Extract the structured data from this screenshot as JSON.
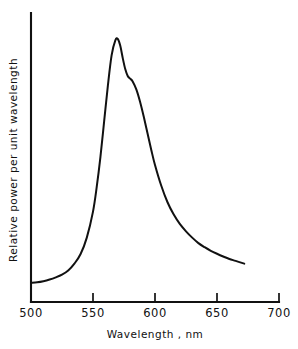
{
  "chart_data": {
    "type": "line",
    "title": "",
    "xlabel": "Wavelength , nm",
    "ylabel": "Relative power per unit wavelength",
    "xlim": [
      500,
      700
    ],
    "ylim": [
      0,
      1.0
    ],
    "xticks": [
      500,
      550,
      600,
      650,
      700
    ],
    "xtick_labels": [
      "500",
      "550",
      "600",
      "650",
      "700"
    ],
    "yticks": [],
    "ytick_labels": [],
    "grid": false,
    "legend": false,
    "series": [
      {
        "name": "Relative spectral power",
        "color": "#111111",
        "x": [
          500,
          505,
          510,
          515,
          520,
          525,
          530,
          535,
          540,
          545,
          550,
          553,
          556,
          559,
          562,
          565,
          568,
          570,
          572,
          574,
          576,
          578,
          580,
          582,
          585,
          588,
          591,
          594,
          597,
          600,
          605,
          610,
          615,
          620,
          625,
          630,
          635,
          640,
          645,
          650,
          655,
          660,
          665,
          672
        ],
        "y": [
          0.07,
          0.072,
          0.076,
          0.082,
          0.09,
          0.1,
          0.115,
          0.14,
          0.175,
          0.235,
          0.33,
          0.42,
          0.53,
          0.66,
          0.79,
          0.9,
          0.955,
          0.96,
          0.935,
          0.89,
          0.85,
          0.825,
          0.815,
          0.805,
          0.775,
          0.73,
          0.675,
          0.615,
          0.555,
          0.5,
          0.425,
          0.365,
          0.32,
          0.285,
          0.258,
          0.235,
          0.215,
          0.2,
          0.187,
          0.176,
          0.166,
          0.157,
          0.15,
          0.14
        ]
      }
    ],
    "annotations": {
      "peak_wavelength_nm": 570,
      "shoulder_wavelength_nm": 580,
      "curve_start_nm": 500,
      "curve_end_nm": 672
    }
  },
  "axes": {
    "x_axis_label": "Wavelength , nm",
    "y_axis_label": "Relative power per unit wavelength"
  }
}
